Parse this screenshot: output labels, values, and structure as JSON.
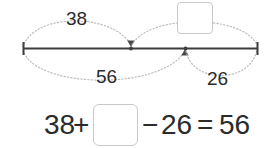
{
  "diagram": {
    "type": "number-line-bar-model",
    "number_line": {
      "left_end_label": "",
      "right_end_label": "",
      "tick_marks": [
        "left-endpoint",
        "inner-point-1",
        "inner-point-2",
        "right-endpoint"
      ]
    },
    "arcs": [
      {
        "id": "arc-38",
        "label": "38",
        "position": "above",
        "span": "left-endpoint-to-inner-point-1"
      },
      {
        "id": "arc-blank",
        "label": "",
        "position": "above",
        "span": "inner-point-1-to-right-endpoint",
        "has_answer_box": true
      },
      {
        "id": "arc-56",
        "label": "56",
        "position": "below",
        "span": "left-endpoint-to-inner-point-2"
      },
      {
        "id": "arc-26",
        "label": "26",
        "position": "below",
        "span": "inner-point-2-to-right-endpoint"
      }
    ],
    "labels": {
      "top_left": "38",
      "bottom_left": "56",
      "bottom_right": "26"
    }
  },
  "equation": {
    "term_1": "38",
    "operator_1": "+",
    "blank": "",
    "operator_2": "−",
    "term_2": "26",
    "equals": "=",
    "result": "56",
    "full_text": "38 + □ − 26 = 56"
  },
  "colors": {
    "background": "#ffffff",
    "line": "#3d3d3d",
    "arc": "#bdbdbd",
    "text": "#2b2b2b",
    "box_border": "#c9c9c9"
  }
}
